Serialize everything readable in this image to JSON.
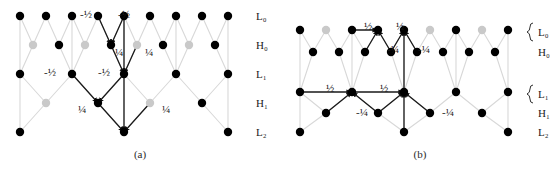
{
  "figure": {
    "captions": {
      "a": "(a)",
      "b": "(b)"
    },
    "colors": {
      "node": "#000000",
      "active_edge": "#1a1a1a",
      "inactive_edge": "#d8d8d8",
      "inactive_node": "#c9c9c9",
      "label": "#1a1a1a",
      "background": "#ffffff"
    }
  },
  "panels": [
    {
      "id": "a",
      "caption": "(a)",
      "row_labels": [
        {
          "text": "L₀",
          "level": "L0",
          "brace": false
        },
        {
          "text": "H₀",
          "level": "H0",
          "brace": false
        },
        {
          "text": "L₁",
          "level": "L1",
          "brace": false
        },
        {
          "text": "H₁",
          "level": "H1",
          "brace": false
        },
        {
          "text": "L₂",
          "level": "L2",
          "brace": false
        }
      ],
      "rows": [
        {
          "level": "L0",
          "y": 16,
          "count": 9,
          "x0": 20,
          "dx": 26
        },
        {
          "level": "H0",
          "y": 45,
          "count": 8,
          "x0": 33,
          "dx": 26
        },
        {
          "level": "L1",
          "y": 74,
          "count": 5,
          "x0": 20,
          "dx": 52
        },
        {
          "level": "H1",
          "y": 103,
          "count": 4,
          "x0": 46,
          "dx": 52
        },
        {
          "level": "L2",
          "y": 132,
          "count": 3,
          "x0": 20,
          "dx": 104
        }
      ],
      "edge_labels": [
        {
          "text": "-½",
          "x": 86,
          "y": 18,
          "group": "H0-predict-left"
        },
        {
          "text": "-½",
          "x": 124,
          "y": 18,
          "group": "H0-predict-right"
        },
        {
          "text": "¼",
          "x": 119,
          "y": 56,
          "group": "L1-update-left"
        },
        {
          "text": "¼",
          "x": 149,
          "y": 56,
          "group": "L1-update-right"
        },
        {
          "text": "-½",
          "x": 50,
          "y": 76,
          "group": "H1-predict-left"
        },
        {
          "text": "-½",
          "x": 104,
          "y": 76,
          "group": "H1-predict-right"
        },
        {
          "text": "¼",
          "x": 82,
          "y": 113,
          "group": "L2-update-left"
        },
        {
          "text": "¼",
          "x": 166,
          "y": 113,
          "group": "L2-update-right"
        }
      ],
      "active_targets": [
        {
          "level": "H0",
          "index": 3
        },
        {
          "level": "L1",
          "index": 2
        },
        {
          "level": "H1",
          "index": 1
        },
        {
          "level": "L2",
          "index": 1
        }
      ]
    },
    {
      "id": "b",
      "caption": "(b)",
      "row_labels": [
        {
          "text": "L₀",
          "level": "L0",
          "brace": true
        },
        {
          "text": "H₀",
          "level": "H0",
          "brace": false
        },
        {
          "text": "L₁",
          "level": "L1",
          "brace": true
        },
        {
          "text": "H₁",
          "level": "H1",
          "brace": false
        },
        {
          "text": "L₂",
          "level": "L2",
          "brace": false
        }
      ],
      "rows": [
        {
          "level": "L0",
          "y": 30,
          "count": 9,
          "x0": 300,
          "dx": 26
        },
        {
          "level": "H0",
          "y": 52,
          "count": 8,
          "x0": 313,
          "dx": 26
        },
        {
          "level": "L1",
          "y": 92,
          "count": 5,
          "x0": 300,
          "dx": 52
        },
        {
          "level": "H1",
          "y": 113,
          "count": 4,
          "x0": 326,
          "dx": 52
        },
        {
          "level": "L2",
          "y": 132,
          "count": 3,
          "x0": 300,
          "dx": 104
        }
      ],
      "edge_labels": [
        {
          "text": "½",
          "x": 368,
          "y": 30,
          "group": "L0-update-left"
        },
        {
          "text": "½",
          "x": 400,
          "y": 30,
          "group": "L0-update-right"
        },
        {
          "text": "-¼",
          "x": 393,
          "y": 53,
          "group": "H0-predict-left"
        },
        {
          "text": "-¼",
          "x": 424,
          "y": 53,
          "group": "H0-predict-right"
        },
        {
          "text": "½",
          "x": 330,
          "y": 92,
          "group": "L1-update-left"
        },
        {
          "text": "½",
          "x": 384,
          "y": 92,
          "group": "L1-update-right"
        },
        {
          "text": "-¼",
          "x": 362,
          "y": 116,
          "group": "H1-predict-left"
        },
        {
          "text": "-¼",
          "x": 448,
          "y": 116,
          "group": "H1-predict-right"
        }
      ],
      "active_targets": [
        {
          "level": "L0",
          "index": 3
        },
        {
          "level": "H0",
          "index": 3
        },
        {
          "level": "L1",
          "index": 1
        },
        {
          "level": "L1b",
          "index": 2
        }
      ]
    }
  ],
  "labels_right": {
    "panel_a_x": 256,
    "panel_b_x": 538
  }
}
